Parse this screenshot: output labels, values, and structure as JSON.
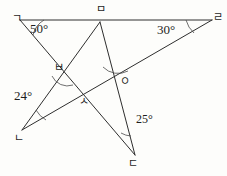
{
  "figure": {
    "background_color": "#fdfdfb",
    "line_color": "#2e2e2e",
    "arc_color": "#4a4a4a",
    "text_color": "#1d1d1d"
  },
  "vertices": [
    {
      "id": "giyeok",
      "label": "ㄱ",
      "x": 20,
      "y": 20,
      "label_x": 12,
      "label_y": 13
    },
    {
      "id": "mieum",
      "label": "ㅁ",
      "x": 100,
      "y": 22,
      "label_x": 96,
      "label_y": 4
    },
    {
      "id": "rieul",
      "label": "ㄹ",
      "x": 212,
      "y": 20,
      "label_x": 213,
      "label_y": 12
    },
    {
      "id": "bieup",
      "label": "ㅂ",
      "x": 67,
      "y": 70,
      "label_x": 54,
      "label_y": 62
    },
    {
      "id": "ieung",
      "label": "ㅇ",
      "x": 118,
      "y": 78,
      "label_x": 120,
      "label_y": 76
    },
    {
      "id": "siot",
      "label": "ㅅ",
      "x": 84,
      "y": 100,
      "label_x": 79,
      "label_y": 96
    },
    {
      "id": "nieun",
      "label": "ㄴ",
      "x": 22,
      "y": 130,
      "label_x": 14,
      "label_y": 133
    },
    {
      "id": "digeut",
      "label": "ㄷ",
      "x": 135,
      "y": 155,
      "label_x": 128,
      "label_y": 158
    }
  ],
  "segments": [
    {
      "id": "top-edge",
      "from": "giyeok",
      "to": "rieul",
      "x1": 20,
      "y1": 20,
      "x2": 212,
      "y2": 20
    },
    {
      "id": "giyeok-digeut",
      "from": "giyeok",
      "to": "digeut",
      "x1": 20,
      "y1": 20,
      "x2": 135,
      "y2": 155
    },
    {
      "id": "mieum-nieun",
      "from": "mieum",
      "to": "nieun",
      "x1": 100,
      "y1": 22,
      "x2": 22,
      "y2": 130
    },
    {
      "id": "mieum-digeut",
      "from": "mieum",
      "to": "digeut",
      "x1": 100,
      "y1": 22,
      "x2": 135,
      "y2": 155
    },
    {
      "id": "nieun-rieul",
      "from": "nieun",
      "to": "rieul",
      "x1": 22,
      "y1": 130,
      "x2": 212,
      "y2": 20
    }
  ],
  "angles": [
    {
      "id": "angle-giyeok",
      "value": "50°",
      "at": "giyeok",
      "label_x": 30,
      "label_y": 22,
      "arc": "M 44 20 A 24 24 0 0 0 33 35"
    },
    {
      "id": "angle-rieul",
      "value": "30°",
      "at": "rieul",
      "label_x": 157,
      "label_y": 23,
      "arc": "M 186 20 A 26 26 0 0 0 194 33"
    },
    {
      "id": "angle-nieun",
      "value": "24°",
      "at": "nieun",
      "label_x": 14,
      "label_y": 89,
      "arc": "M 36 110 A 26 26 0 0 0 46 120"
    },
    {
      "id": "angle-digeut",
      "value": "25°",
      "at": "digeut",
      "label_x": 136,
      "label_y": 113,
      "arc": "M 121 133 A 22 22 0 0 0 131 136"
    }
  ],
  "intersection_arcs": [
    {
      "id": "arc-bieup",
      "at": "bieup",
      "path": "M 52 76 A 17 17 0 0 0 73 85"
    },
    {
      "id": "arc-ieung",
      "at": "ieung",
      "path": "M 103 67 A 21 21 0 0 0 128 71"
    }
  ]
}
